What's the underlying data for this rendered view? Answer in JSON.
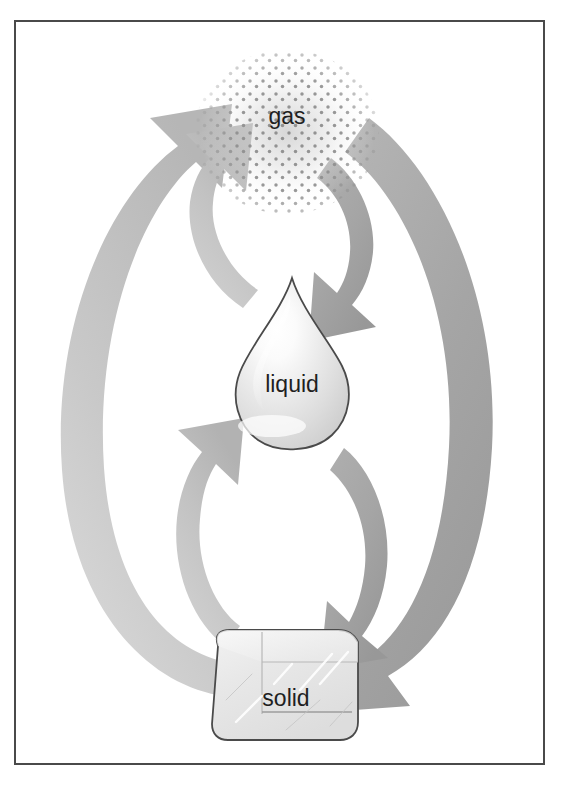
{
  "figure": {
    "background_color": "#ffffff",
    "border_color": "#4a4a4a"
  },
  "states": [
    {
      "id": "gas",
      "label": "gas",
      "shape": "dot-cloud",
      "center": [
        287,
        120
      ],
      "radius": 85,
      "label_color": "#1f1f1f",
      "label_size": 23
    },
    {
      "id": "liquid",
      "label": "liquid",
      "shape": "teardrop",
      "center": [
        292,
        385
      ],
      "outline_color": "#4a4a4a",
      "label_color": "#1f1f1f",
      "label_size": 23
    },
    {
      "id": "solid",
      "label": "solid",
      "shape": "ice-cube",
      "center": [
        285,
        692
      ],
      "outline_color": "#4a4a4a",
      "label_color": "#1f1f1f",
      "label_size": 23
    }
  ],
  "arrows": [
    {
      "id": "sublimation",
      "from": "solid",
      "to": "gas",
      "direction": "up",
      "side": "outer-left",
      "color": "#c9c9c9"
    },
    {
      "id": "deposition",
      "from": "gas",
      "to": "solid",
      "direction": "down",
      "side": "outer-right",
      "color": "#a5a5a5"
    },
    {
      "id": "evaporation",
      "from": "liquid",
      "to": "gas",
      "direction": "up",
      "side": "inner-upper-left",
      "color": "#c2c2c2"
    },
    {
      "id": "condensation",
      "from": "gas",
      "to": "liquid",
      "direction": "down",
      "side": "inner-upper-right",
      "color": "#a5a5a5"
    },
    {
      "id": "melting",
      "from": "solid",
      "to": "liquid",
      "direction": "up",
      "side": "inner-lower-left",
      "color": "#c2c2c2"
    },
    {
      "id": "freezing",
      "from": "liquid",
      "to": "solid",
      "direction": "down",
      "side": "inner-lower-right",
      "color": "#a5a5a5"
    }
  ],
  "colors": {
    "arrow_light": "#c9c9c9",
    "arrow_mid": "#c2c2c2",
    "arrow_dark": "#a5a5a5",
    "outline": "#4a4a4a",
    "gas_dot": "#9a9a9a",
    "text": "#1f1f1f"
  }
}
